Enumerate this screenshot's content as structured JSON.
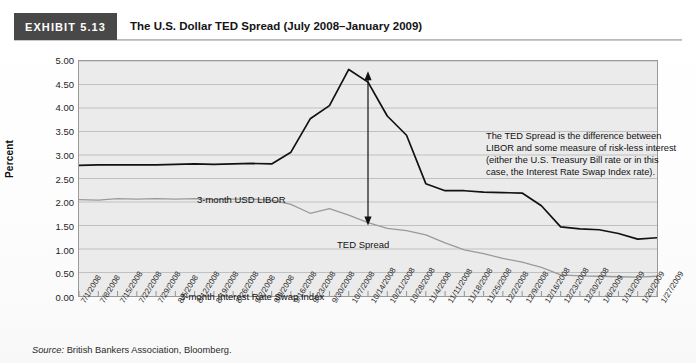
{
  "header": {
    "exhibit_tag": "EXHIBIT 5.13",
    "title": "The U.S. Dollar TED Spread (July 2008–January 2009)"
  },
  "source": {
    "prefix": "Source:",
    "text": "British Bankers Association, Bloomberg."
  },
  "annotation": {
    "text": "The TED Spread is the difference between LIBOR and some measure of risk-less interest (either the U.S. Treasury Bill rate or in this case, the Interest Rate Swap Index rate)."
  },
  "labels": {
    "libor": "3-month USD LIBOR",
    "ted_spread": "TED Spread",
    "swap_index": "3-month Interest Rate Swap Index"
  },
  "colors": {
    "exhibit_tag_bg": "#484848",
    "plot_bg": "#ebebeb",
    "gridline": "#b4b4b4",
    "libor_line": "#111111",
    "swap_line": "#9a9a9a",
    "arrow": "#111111",
    "frame": "#9a9a9a"
  },
  "chart_data": {
    "type": "line",
    "title": "The U.S. Dollar TED Spread (July 2008–January 2009)",
    "xlabel": "",
    "ylabel": "Percent",
    "ylim": [
      0.0,
      5.0
    ],
    "ytick_step": 0.5,
    "ytick_labels": [
      "0.00",
      "0.50",
      "1.00",
      "1.50",
      "2.00",
      "2.50",
      "3.00",
      "3.50",
      "4.00",
      "4.50",
      "5.00"
    ],
    "grid": true,
    "legend_position": "in-plot annotations",
    "x": [
      "7/1/2008",
      "7/8/2008",
      "7/15/2008",
      "7/22/2008",
      "7/29/2008",
      "8/5/2008",
      "8/12/2008",
      "8/19/2008",
      "8/26/2008",
      "9/2/2008",
      "9/9/2008",
      "9/16/2008",
      "9/23/2008",
      "9/30/2008",
      "10/7/2008",
      "10/14/2008",
      "10/21/2008",
      "10/28/2008",
      "11/4/2008",
      "11/11/2008",
      "11/18/2008",
      "11/25/2008",
      "12/2/2008",
      "12/9/2008",
      "12/16/2008",
      "12/23/2008",
      "12/30/2008",
      "1/6/2009",
      "1/13/2009",
      "1/20/2009",
      "1/27/2009"
    ],
    "series": [
      {
        "name": "3-month USD LIBOR",
        "color": "#111111",
        "values": [
          2.78,
          2.79,
          2.79,
          2.79,
          2.79,
          2.8,
          2.81,
          2.8,
          2.81,
          2.82,
          2.81,
          3.06,
          3.77,
          4.05,
          4.82,
          4.55,
          3.83,
          3.42,
          2.39,
          2.24,
          2.24,
          2.21,
          2.2,
          2.19,
          1.92,
          1.47,
          1.43,
          1.41,
          1.33,
          1.21,
          1.24
        ]
      },
      {
        "name": "3-month Interest Rate Swap Index",
        "color": "#9a9a9a",
        "values": [
          2.05,
          2.04,
          2.07,
          2.06,
          2.07,
          2.06,
          2.07,
          2.05,
          2.06,
          2.06,
          2.04,
          1.95,
          1.76,
          1.86,
          1.72,
          1.56,
          1.44,
          1.39,
          1.3,
          1.13,
          0.98,
          0.9,
          0.8,
          0.72,
          0.61,
          0.45,
          0.43,
          0.42,
          0.41,
          0.4,
          0.42
        ]
      }
    ],
    "annotations": [
      {
        "kind": "double-arrow",
        "text": "TED Spread",
        "x": "10/14/2008",
        "y_top": 4.78,
        "y_bottom": 1.5
      }
    ]
  }
}
